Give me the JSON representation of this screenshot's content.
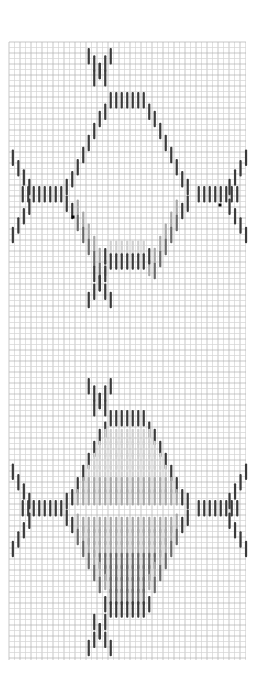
{
  "chart_data": {
    "type": "stitch-chart",
    "title": "",
    "grid": {
      "x0": 9,
      "y0": 42,
      "x1": 246,
      "y1": 660,
      "cell": 5.5,
      "minor_color": "#d4d4d4",
      "major_color": "#b0b0b0",
      "major_every": 2
    },
    "colors": {
      "dark": "#3a3a3a",
      "medium": "#6a6a6a",
      "light": "#a8a8a8",
      "pale": "#d0d0d0",
      "dot": "#000000"
    },
    "stitch": {
      "width": 2.2,
      "length_cells": 3
    },
    "motifs": [
      {
        "name": "upper-hexagon",
        "top_y": 48,
        "waist_top_y": 92,
        "mid_y": 186,
        "waist_bottom_y": 250,
        "bottom_y": 340,
        "fill": "outline"
      },
      {
        "name": "lower-hexagon",
        "top_y": 378,
        "waist_top_y": 410,
        "mid_y": 500,
        "waist_bottom_y": 598,
        "bottom_y": 655,
        "fill": "shaded"
      }
    ],
    "markers": [
      {
        "name": "left-marker-dot",
        "x": 73,
        "y": 217
      },
      {
        "name": "right-marker-dot",
        "x": 220,
        "y": 205
      }
    ]
  }
}
